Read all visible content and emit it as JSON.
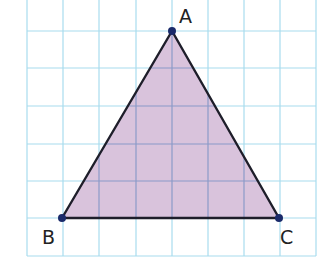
{
  "figure": {
    "type": "triangle-on-grid",
    "colors": {
      "background": "#ffffff",
      "grid": "#a8dcee",
      "grid_over_fill": "#8a9ac8",
      "fill": "#d9c3dc",
      "edge": "#1e1e2a",
      "vertex": "#1a2a6a",
      "label": "#222222"
    },
    "grid": {
      "x_lines": [
        27,
        63,
        99,
        136,
        172,
        208,
        244,
        280,
        316
      ],
      "y_lines": [
        31,
        68,
        106,
        144,
        181,
        218,
        256
      ],
      "x_min": 27,
      "x_max": 316,
      "y_min": 0,
      "y_max": 256
    },
    "vertices": [
      {
        "name": "A",
        "x": 172,
        "y": 31,
        "label_x": 179,
        "label_y": 23
      },
      {
        "name": "B",
        "x": 62,
        "y": 218,
        "label_x": 42,
        "label_y": 244
      },
      {
        "name": "C",
        "x": 279,
        "y": 218,
        "label_x": 280,
        "label_y": 244
      }
    ]
  },
  "labels": {
    "A": "A",
    "B": "B",
    "C": "C"
  }
}
